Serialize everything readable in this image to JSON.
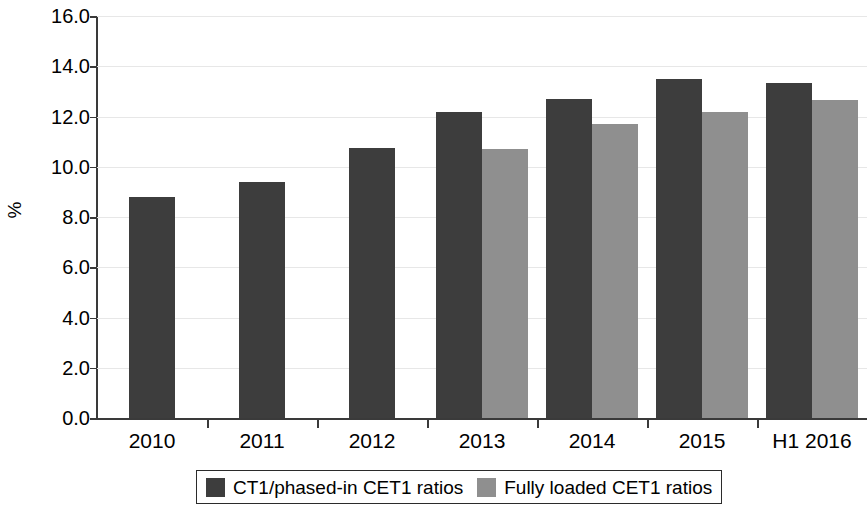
{
  "chart_data": {
    "type": "bar",
    "title": "",
    "subtitle": "",
    "xlabel": "",
    "ylabel": "%",
    "ylim": [
      0.0,
      16.0
    ],
    "ytick_step": 2.0,
    "ytick_labels": [
      "0.0",
      "2.0",
      "4.0",
      "6.0",
      "8.0",
      "10.0",
      "12.0",
      "14.0",
      "16.0"
    ],
    "ytick_values": [
      0.0,
      2.0,
      4.0,
      6.0,
      8.0,
      10.0,
      12.0,
      14.0,
      16.0
    ],
    "grid": true,
    "grid_axis": "y",
    "legend_position": "bottom",
    "categories": [
      "2010",
      "2011",
      "2012",
      "2013",
      "2014",
      "2015",
      "H1 2016"
    ],
    "series": [
      {
        "name": "CT1/phased-in CET1 ratios",
        "color": "#3d3d3d",
        "values": [
          8.8,
          9.4,
          10.75,
          12.2,
          12.7,
          13.5,
          13.35
        ]
      },
      {
        "name": "Fully loaded CET1 ratios",
        "color": "#8f8f8f",
        "values": [
          null,
          null,
          null,
          10.7,
          11.7,
          12.2,
          12.65
        ]
      }
    ]
  },
  "legend": {
    "entries": [
      {
        "label": "CT1/phased-in CET1 ratios",
        "color": "#3d3d3d"
      },
      {
        "label": "Fully loaded CET1 ratios",
        "color": "#8f8f8f"
      }
    ]
  },
  "axes": {
    "y_title": "%",
    "axis_color": "#3a3a3a",
    "grid_color": "#e7e7e7"
  }
}
